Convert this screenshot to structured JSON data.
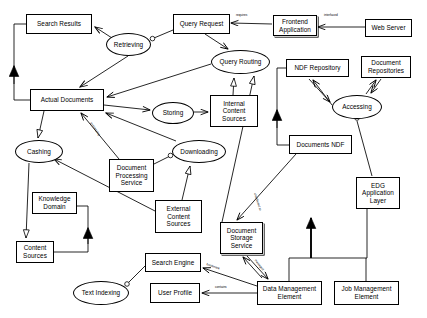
{
  "diagram": {
    "background": "#ffffff",
    "line_color": "#000000",
    "nodes": [
      {
        "id": "search-results",
        "label": "Search Results",
        "shape": "box",
        "x": 26,
        "y": 14,
        "w": 66,
        "h": 20
      },
      {
        "id": "query-request",
        "label": "Query Request",
        "shape": "box",
        "x": 173,
        "y": 14,
        "w": 57,
        "h": 20
      },
      {
        "id": "frontend-application",
        "label": "Frontend\nApplication",
        "shape": "box",
        "x": 273,
        "y": 15,
        "w": 44,
        "h": 21,
        "shadowed": true
      },
      {
        "id": "web-server",
        "label": "Web Server",
        "shape": "box",
        "x": 365,
        "y": 19,
        "w": 47,
        "h": 18
      },
      {
        "id": "retrieving",
        "label": "Retrieving",
        "shape": "ellipse",
        "x": 106,
        "y": 33,
        "w": 45,
        "h": 23
      },
      {
        "id": "query-routing",
        "label": "Query Routing",
        "shape": "ellipse",
        "x": 211,
        "y": 50,
        "w": 59,
        "h": 24
      },
      {
        "id": "ndf-repository",
        "label": "NDF Repository",
        "shape": "box",
        "x": 286,
        "y": 59,
        "w": 63,
        "h": 18
      },
      {
        "id": "document-repositories",
        "label": "Document\nRepositories",
        "shape": "box",
        "x": 361,
        "y": 56,
        "w": 50,
        "h": 22
      },
      {
        "id": "actual-documents",
        "label": "Actual Documents",
        "shape": "box",
        "x": 30,
        "y": 89,
        "w": 74,
        "h": 22
      },
      {
        "id": "storing",
        "label": "Storing",
        "shape": "ellipse",
        "x": 152,
        "y": 102,
        "w": 42,
        "h": 22
      },
      {
        "id": "internal-content-sources",
        "label": "Internal\nContent\nSources",
        "shape": "box",
        "x": 210,
        "y": 95,
        "w": 48,
        "h": 32
      },
      {
        "id": "accessing",
        "label": "Accessing",
        "shape": "ellipse",
        "x": 332,
        "y": 95,
        "w": 50,
        "h": 24
      },
      {
        "id": "cashing",
        "label": "Cashing",
        "shape": "ellipse",
        "x": 15,
        "y": 140,
        "w": 48,
        "h": 23
      },
      {
        "id": "downloading",
        "label": "Downloading",
        "shape": "ellipse",
        "x": 172,
        "y": 140,
        "w": 54,
        "h": 23
      },
      {
        "id": "documents-ndf",
        "label": "Documents NDF",
        "shape": "box",
        "x": 289,
        "y": 135,
        "w": 63,
        "h": 19
      },
      {
        "id": "document-processing-service",
        "label": "Document\nProcessing\nService",
        "shape": "box",
        "x": 109,
        "y": 159,
        "w": 45,
        "h": 33
      },
      {
        "id": "knowledge-domain",
        "label": "Knowledge\nDomain",
        "shape": "box",
        "x": 32,
        "y": 192,
        "w": 45,
        "h": 22
      },
      {
        "id": "edg-application-layer",
        "label": "EDG\nApplication\nLayer",
        "shape": "box",
        "x": 356,
        "y": 177,
        "w": 44,
        "h": 32
      },
      {
        "id": "external-content-sources",
        "label": "External\nContent\nSources",
        "shape": "box",
        "x": 155,
        "y": 200,
        "w": 47,
        "h": 33
      },
      {
        "id": "document-storage-service",
        "label": "Document\nStorage\nService",
        "shape": "box",
        "x": 220,
        "y": 222,
        "w": 43,
        "h": 32,
        "shadowed": true
      },
      {
        "id": "content-sources",
        "label": "Content\nSources",
        "shape": "box",
        "x": 16,
        "y": 241,
        "w": 38,
        "h": 22
      },
      {
        "id": "search-engine",
        "label": "Search Engine",
        "shape": "box",
        "x": 145,
        "y": 253,
        "w": 56,
        "h": 19
      },
      {
        "id": "text-indexing",
        "label": "Text Indexing",
        "shape": "ellipse",
        "x": 73,
        "y": 281,
        "w": 56,
        "h": 24
      },
      {
        "id": "user-profile",
        "label": "User Profile",
        "shape": "box",
        "x": 150,
        "y": 283,
        "w": 50,
        "h": 20
      },
      {
        "id": "data-management-element",
        "label": "Data Management\nElement",
        "shape": "box",
        "x": 257,
        "y": 281,
        "w": 65,
        "h": 24
      },
      {
        "id": "job-management-element",
        "label": "Job Management\nElement",
        "shape": "box",
        "x": 334,
        "y": 281,
        "w": 65,
        "h": 24
      }
    ],
    "edge_labels": [
      {
        "id": "label-requires",
        "text": "requires",
        "x": 236,
        "y": 14,
        "rotate": 0
      },
      {
        "id": "label-interfaced",
        "text": "interfaced",
        "x": 324,
        "y": 14,
        "rotate": 0
      },
      {
        "id": "label-processing",
        "text": "processing",
        "x": 92,
        "y": 122,
        "rotate": 56
      },
      {
        "id": "label-distributed-to",
        "text": "distributed to",
        "x": 256,
        "y": 193,
        "rotate": 72
      },
      {
        "id": "label-managed",
        "text": "managed",
        "x": 256,
        "y": 259,
        "rotate": 52
      },
      {
        "id": "label-bookmark",
        "text": "bookmark",
        "x": 207,
        "y": 263,
        "rotate": 20
      },
      {
        "id": "label-contains",
        "text": "contains",
        "x": 215,
        "y": 286,
        "rotate": 0
      }
    ]
  }
}
